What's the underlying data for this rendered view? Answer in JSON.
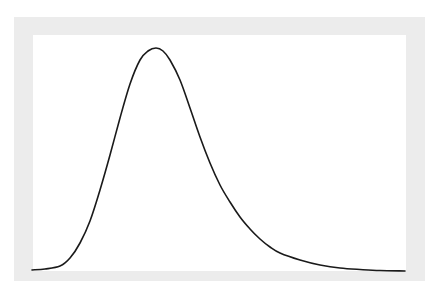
{
  "chart_data": {
    "type": "line",
    "title": "",
    "xlabel": "",
    "ylabel": "",
    "grid": false,
    "legend": null,
    "series": [
      {
        "name": "density",
        "color": "#1a1a1a",
        "points_px": [
          [
            32,
            270
          ],
          [
            45,
            269
          ],
          [
            60,
            266
          ],
          [
            70,
            258
          ],
          [
            80,
            243
          ],
          [
            90,
            221
          ],
          [
            100,
            190
          ],
          [
            110,
            155
          ],
          [
            120,
            118
          ],
          [
            130,
            84
          ],
          [
            140,
            60
          ],
          [
            148,
            51
          ],
          [
            156,
            48
          ],
          [
            163,
            51
          ],
          [
            170,
            60
          ],
          [
            180,
            80
          ],
          [
            190,
            108
          ],
          [
            200,
            137
          ],
          [
            210,
            163
          ],
          [
            220,
            185
          ],
          [
            230,
            202
          ],
          [
            240,
            217
          ],
          [
            250,
            229
          ],
          [
            260,
            239
          ],
          [
            270,
            247
          ],
          [
            280,
            253
          ],
          [
            300,
            260
          ],
          [
            320,
            265
          ],
          [
            340,
            268
          ],
          [
            360,
            269.5
          ],
          [
            380,
            270.5
          ],
          [
            405,
            271
          ]
        ]
      }
    ],
    "colors": {
      "frame": "#ececec",
      "plot_bg": "#ffffff",
      "line": "#1a1a1a"
    }
  }
}
